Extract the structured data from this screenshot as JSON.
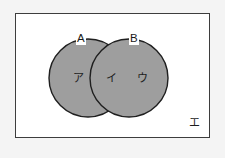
{
  "figure": {
    "type": "venn-diagram",
    "sets": [
      {
        "id": "A",
        "label": "A"
      },
      {
        "id": "B",
        "label": "B"
      }
    ],
    "regions": [
      {
        "id": "a-only",
        "label": "ア"
      },
      {
        "id": "intersection",
        "label": "イ"
      },
      {
        "id": "b-only",
        "label": "ウ"
      },
      {
        "id": "outside",
        "label": "エ"
      }
    ],
    "colors": {
      "page_background": "#f4f4f4",
      "frame_background": "#ffffff",
      "frame_border": "#3d3d3d",
      "circle_fill": "#9e9e9e",
      "circle_stroke": "#1f1f1f",
      "text": "#1a1a1a"
    },
    "geometry": {
      "frame": {
        "x": 15,
        "y": 13,
        "width": 195,
        "height": 125
      },
      "circle_a": {
        "cx": 88,
        "cy": 78,
        "r": 39
      },
      "circle_b": {
        "cx": 129,
        "cy": 78,
        "r": 39
      }
    }
  }
}
